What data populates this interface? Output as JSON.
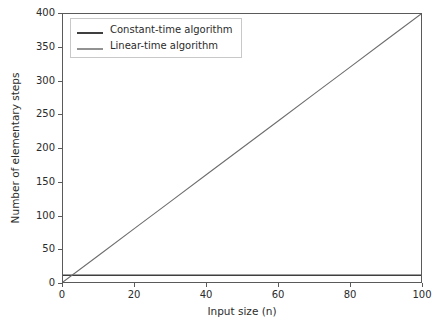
{
  "chart_data": {
    "type": "line",
    "title": "",
    "xlabel": "Input size (n)",
    "ylabel": "Number of elementary steps",
    "xlim": [
      0,
      100
    ],
    "ylim": [
      0,
      400
    ],
    "xticks": [
      0,
      20,
      40,
      60,
      80,
      100
    ],
    "yticks": [
      0,
      50,
      100,
      150,
      200,
      250,
      300,
      350,
      400
    ],
    "xtick_labels": [
      "0",
      "20",
      "40",
      "60",
      "80",
      "100"
    ],
    "ytick_labels": [
      "0",
      "50",
      "100",
      "150",
      "200",
      "250",
      "300",
      "350",
      "400"
    ],
    "grid": false,
    "legend_position": "upper left",
    "series": [
      {
        "name": "Constant-time algorithm",
        "color": "#3f3f3f",
        "linewidth": 1.6,
        "x": [
          0,
          10,
          20,
          30,
          40,
          50,
          60,
          70,
          80,
          90,
          100
        ],
        "values": [
          10,
          10,
          10,
          10,
          10,
          10,
          10,
          10,
          10,
          10,
          10
        ]
      },
      {
        "name": "Linear-time algorithm",
        "color": "#6e6e6e",
        "linewidth": 1.1,
        "x": [
          0,
          10,
          20,
          30,
          40,
          50,
          60,
          70,
          80,
          90,
          100
        ],
        "values": [
          0,
          40,
          80,
          120,
          160,
          200,
          240,
          280,
          320,
          360,
          400
        ]
      }
    ]
  },
  "legend": {
    "entries": [
      {
        "label": "Constant-time algorithm"
      },
      {
        "label": "Linear-time algorithm"
      }
    ]
  },
  "axes": {
    "x_axis_label": "Input size (n)",
    "y_axis_label": "Number of elementary steps"
  },
  "colors": {
    "background": "#ffffff",
    "frame": "#5a5a5a",
    "text": "#2b2b2b",
    "constant_series": "#3f3f3f",
    "linear_series": "#6e6e6e"
  }
}
